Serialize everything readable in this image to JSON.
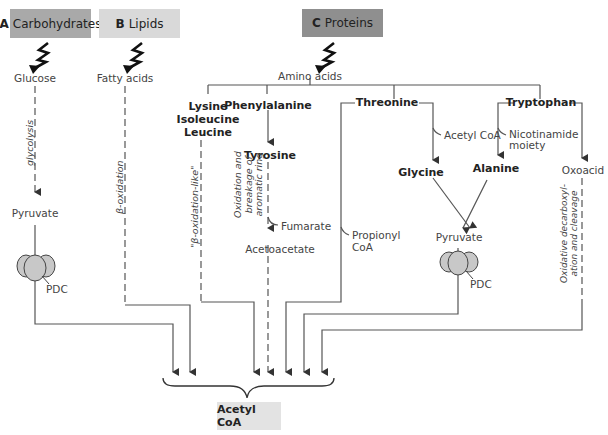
{
  "sources": {
    "a": {
      "letter": "A",
      "label": "Carbohydrates",
      "color": "#a9a9a9"
    },
    "b": {
      "letter": "B",
      "label": "Lipids",
      "color": "#d9d9d9"
    },
    "c": {
      "letter": "C",
      "label": "Proteins",
      "color": "#8f8f8f"
    }
  },
  "carbohydrate_path": {
    "start": "Glucose",
    "process": "glycolysis",
    "product": "Pyruvate",
    "enzyme": "PDC"
  },
  "lipid_path": {
    "start": "Fatty acids",
    "process": "β-oxidation"
  },
  "protein_path": {
    "start": "Amino acids",
    "lysine_group": {
      "line1": "Lysine",
      "line2": "Isoleucine",
      "line3": "Leucine",
      "process": "\"β-oxidation-like\""
    },
    "phenylalanine": {
      "name": "Phenylalanine",
      "product": "Tyrosine",
      "process_line1": "Oxidation and",
      "process_line2": "breakage of",
      "process_line3": "aromatic ring",
      "side_product": "Fumarate",
      "final": "Acetoacetate"
    },
    "threonine": {
      "name": "Threonine",
      "side_product": "Acetyl CoA",
      "product": "Glycine",
      "other_product_line1": "Propionyl",
      "other_product_line2": "CoA"
    },
    "tryptophan": {
      "name": "Tryptophan",
      "side_product_line1": "Nicotinamide",
      "side_product_line2": "moiety",
      "product": "Alanine",
      "other_product": "Oxoacid",
      "process_line1": "Oxidative decarboxyl-",
      "process_line2": "ation and cleavage"
    },
    "pyruvate": "Pyruvate",
    "enzyme": "PDC"
  },
  "target": {
    "label": "Acetyl CoA",
    "color": "#e3e3e3"
  }
}
